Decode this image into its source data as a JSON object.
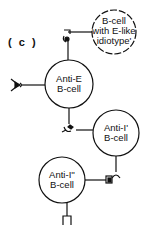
{
  "panel_label": "( c )",
  "cells": {
    "e_like": {
      "line1": "B-cell",
      "line2": "with E-like",
      "line3": "idiotype'"
    },
    "anti_e": {
      "line1": "Anti-E",
      "line2": "B-cell"
    },
    "anti_i1": {
      "line1": "Anti-I'",
      "line2": "B-cell"
    },
    "anti_i2": {
      "line1": "Anti-I''",
      "line2": "B-cell"
    }
  },
  "colors": {
    "stroke": "#111111",
    "background": "#ffffff"
  }
}
